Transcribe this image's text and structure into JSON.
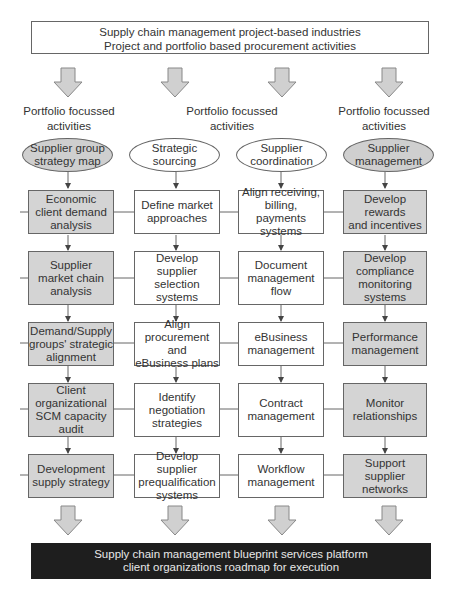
{
  "header": {
    "line1": "Supply chain management project-based industries",
    "line2": "Project and portfolio based procurement activities"
  },
  "column_headers": [
    {
      "line1": "Portfolio focussed",
      "line2": "activities"
    },
    {
      "line1": "Portfolio focussed",
      "line2": "activities"
    },
    {
      "line1": "Portfolio focussed",
      "line2": "activities"
    }
  ],
  "columns": [
    {
      "title": [
        "Supplier group",
        "strategy map"
      ],
      "shaded": true,
      "steps": [
        [
          "Economic",
          "client demand",
          "analysis"
        ],
        [
          "Supplier",
          "market chain",
          "analysis"
        ],
        [
          "Demand/Supply",
          "groups' strategic",
          "alignment"
        ],
        [
          "Client",
          "organizational",
          "SCM capacity",
          "audit"
        ],
        [
          "Development",
          "supply strategy"
        ]
      ]
    },
    {
      "title": [
        "Strategic",
        "sourcing"
      ],
      "shaded": false,
      "steps": [
        [
          "Define market",
          "approaches"
        ],
        [
          "Develop supplier",
          "selection",
          "systems"
        ],
        [
          "Align",
          "procurement and",
          "eBusiness plans"
        ],
        [
          "Identify",
          "negotiation",
          "strategies"
        ],
        [
          "Develop supplier",
          "prequalification",
          "systems"
        ]
      ]
    },
    {
      "title": [
        "Supplier",
        "coordination"
      ],
      "shaded": false,
      "steps": [
        [
          "Align receiving,",
          "billing, payments",
          "systems"
        ],
        [
          "Document",
          "management",
          "flow"
        ],
        [
          "eBusiness",
          "management"
        ],
        [
          "Contract",
          "management"
        ],
        [
          "Workflow",
          "management"
        ]
      ]
    },
    {
      "title": [
        "Supplier",
        "management"
      ],
      "shaded": true,
      "steps": [
        [
          "Develop rewards",
          "and incentives"
        ],
        [
          "Develop",
          "compliance",
          "monitoring",
          "systems"
        ],
        [
          "Performance",
          "management"
        ],
        [
          "Monitor",
          "relationships"
        ],
        [
          "Support supplier",
          "networks"
        ]
      ]
    }
  ],
  "footer": {
    "line1": "Supply chain management blueprint services platform",
    "line2": "client organizations roadmap for execution"
  },
  "colors": {
    "shaded_fill": "#d4d4d4",
    "arrow_fill": "#d0d0d0",
    "footer_bg": "#1e1e1e",
    "footer_text": "#e8e8e8",
    "border": "#666666"
  }
}
